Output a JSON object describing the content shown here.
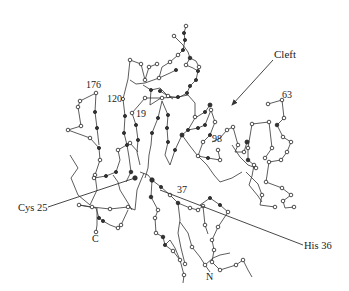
{
  "figure": {
    "labels": {
      "cleft": "Cleft",
      "res176": "176",
      "res120": "120",
      "res19": "19",
      "res98": "98",
      "res63": "63",
      "res37": "37",
      "cys25": "Cys 25",
      "his36": "His 36",
      "c_term": "C",
      "n_term": "N"
    },
    "colors": {
      "line": "#333333",
      "background": "#ffffff",
      "text": "#222222"
    }
  }
}
